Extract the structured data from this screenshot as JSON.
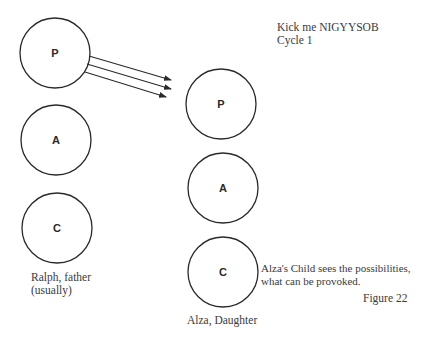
{
  "title": {
    "line1": "Kick me NIGYYSOB",
    "line2": "Cycle 1"
  },
  "left_person": {
    "label_line1": "Ralph, father",
    "label_line2": "(usually)",
    "states": [
      {
        "letter": "P",
        "name": "Parent"
      },
      {
        "letter": "A",
        "name": "Adult"
      },
      {
        "letter": "C",
        "name": "Child"
      }
    ]
  },
  "right_person": {
    "label": "Alza, Daughter",
    "states": [
      {
        "letter": "P",
        "name": "Parent"
      },
      {
        "letter": "A",
        "name": "Adult"
      },
      {
        "letter": "C",
        "name": "Child"
      }
    ]
  },
  "annotation": {
    "line1": "Alza's Child sees the possibilities,",
    "line2": "what can be provoked."
  },
  "figure_label": "Figure 22",
  "transactions": [
    {
      "from": "left.P",
      "to": "right.P",
      "count": 3
    }
  ],
  "colors": {
    "stroke": "#2a2a2a",
    "text": "#3a3a3a",
    "background": "#ffffff"
  }
}
